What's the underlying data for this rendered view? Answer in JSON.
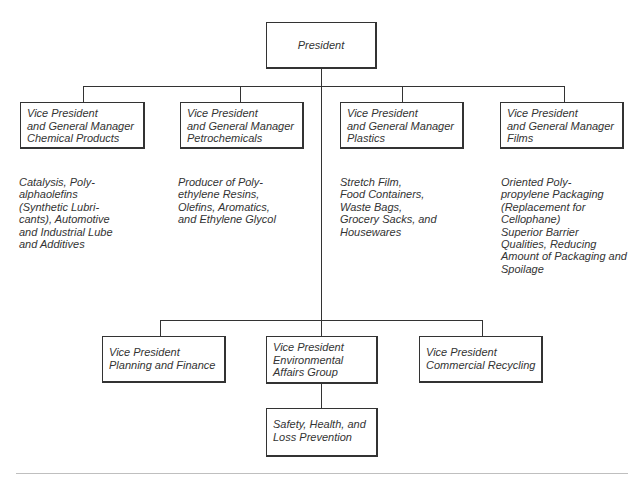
{
  "president": {
    "label": "President"
  },
  "division_heads": [
    {
      "lines": [
        "Vice President",
        "and General Manager",
        "Chemical Products"
      ],
      "description": [
        "Catalysis, Poly-",
        "alphaolefins",
        "(Synthetic Lubri-",
        "cants), Automotive",
        "and Industrial Lube",
        "and Additives"
      ]
    },
    {
      "lines": [
        "Vice President",
        "and General Manager",
        "Petrochemicals"
      ],
      "description": [
        "Producer of Poly-",
        "ethylene Resins,",
        "Olefins, Aromatics,",
        "and Ethylene Glycol"
      ]
    },
    {
      "lines": [
        "Vice President",
        "and General Manager",
        "Plastics"
      ],
      "description": [
        "Stretch Film,",
        "Food Containers,",
        "Waste Bags,",
        "Grocery Sacks, and",
        "Housewares"
      ]
    },
    {
      "lines": [
        "Vice President",
        "and General Manager",
        "Films"
      ],
      "description": [
        "Oriented Poly-",
        "propylene Packaging",
        "(Replacement for",
        "Cellophane)",
        "Superior Barrier",
        "Qualities, Reducing",
        "Amount of Packaging and",
        "Spoilage"
      ]
    }
  ],
  "staff_heads": [
    {
      "lines": [
        "Vice President",
        "Planning and Finance"
      ]
    },
    {
      "lines": [
        "Vice President",
        "Environmental",
        "Affairs Group"
      ]
    },
    {
      "lines": [
        "Vice President",
        "Commercial Recycling"
      ]
    }
  ],
  "sub_unit": {
    "lines": [
      "Safety, Health, and",
      "Loss Prevention"
    ]
  }
}
